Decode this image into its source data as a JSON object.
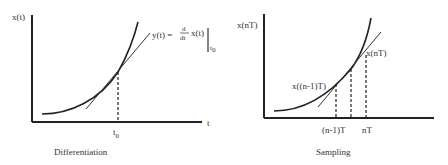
{
  "left": {
    "caption": "Differentiation",
    "y_axis_label": "x(t)",
    "x_axis_label": "t",
    "tick_label": "t",
    "tick_sub": "0",
    "eq_lhs": "y(t) =",
    "eq_num": "d",
    "eq_den": "dt",
    "eq_fn": "x(t)",
    "eq_eval_sub": "t",
    "eq_eval_sub2": "0"
  },
  "right": {
    "caption": "Sampling",
    "y_axis_label": "x(nT)",
    "point_label_upper": "x(nT)",
    "point_label_lower": "x((n-1)T)",
    "tick_left": "(n-1)T",
    "tick_right": "nT"
  },
  "colors": {
    "stroke": "#222222",
    "text": "#333333",
    "background": "#ffffff"
  }
}
